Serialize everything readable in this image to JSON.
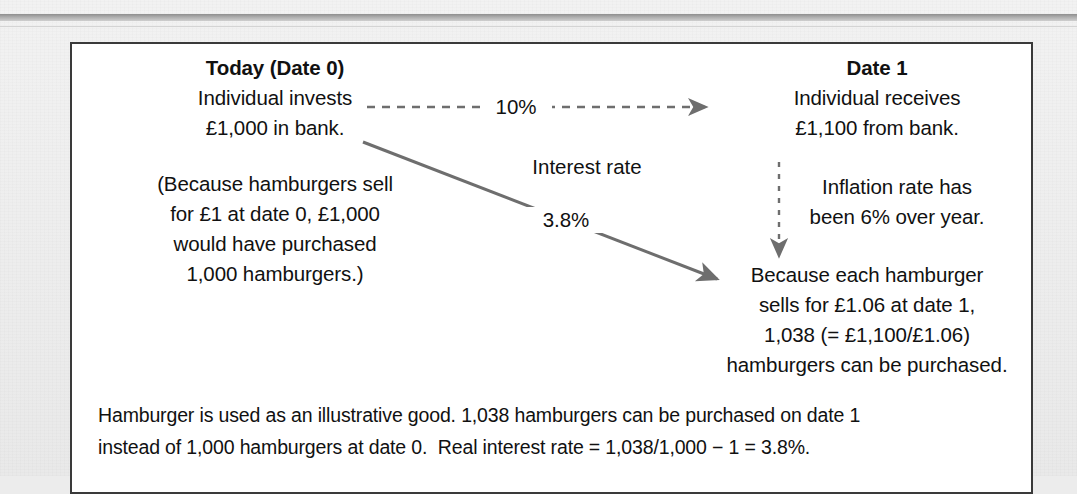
{
  "figure": {
    "left_column": {
      "heading": "Today (Date 0)",
      "lines": [
        "Individual invests",
        "£1,000 in bank."
      ],
      "note_lines": [
        "(Because hamburgers sell",
        "for £1 at date 0, £1,000",
        "would have purchased",
        "1,000 hamburgers.)"
      ]
    },
    "middle": {
      "interest_arrow_label": "10%",
      "interest_rate_caption": "Interest rate",
      "real_rate_label": "3.8%"
    },
    "right_column": {
      "heading": "Date 1",
      "lines": [
        "Individual receives",
        "£1,100 from bank."
      ],
      "inflation_lines": [
        "Inflation rate has",
        "been 6% over year."
      ],
      "hamburger_lines": [
        "Because each hamburger",
        "sells for £1.06 at date 1,",
        "1,038 (= £1,100/£1.06)",
        "hamburgers can be purchased."
      ]
    },
    "caption": {
      "line1": "Hamburger is used as an illustrative good. 1,038 hamburgers can be purchased on date 1",
      "line2": "instead of 1,000 hamburgers at date 0.  Real interest rate = 1,038/1,000 − 1 = 3.8%."
    },
    "colors": {
      "page_background": "#eeeeee",
      "box_background": "#ffffff",
      "box_border": "#3a3a3a",
      "text": "#111111",
      "arrow": "#6e6e6e",
      "rule": "#9a9a9a"
    }
  }
}
